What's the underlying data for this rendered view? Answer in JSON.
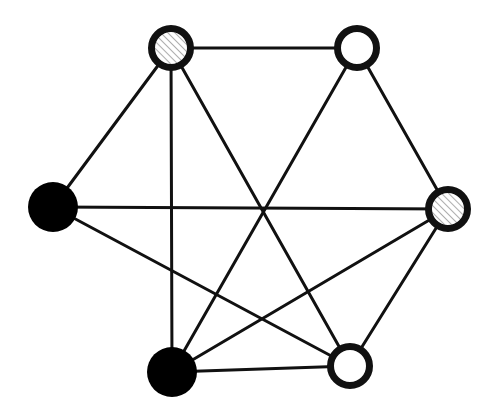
{
  "diagram": {
    "type": "undirected-graph",
    "width": 500,
    "height": 410,
    "colors": {
      "background": "#ffffff",
      "stroke": "#111111",
      "filled": "#000000",
      "empty": "#ffffff",
      "hatch_line": "#9a9a9a"
    },
    "edge_width": 3,
    "node_stroke_width": 7,
    "nodes": [
      {
        "id": "A",
        "x": 171,
        "y": 48,
        "r": 20,
        "style": "hatched"
      },
      {
        "id": "B",
        "x": 357,
        "y": 48,
        "r": 20,
        "style": "empty"
      },
      {
        "id": "C",
        "x": 53,
        "y": 207,
        "r": 25,
        "style": "filled"
      },
      {
        "id": "D",
        "x": 448,
        "y": 209,
        "r": 20,
        "style": "hatched"
      },
      {
        "id": "E",
        "x": 172,
        "y": 372,
        "r": 25,
        "style": "filled"
      },
      {
        "id": "F",
        "x": 350,
        "y": 366,
        "r": 20,
        "style": "empty"
      }
    ],
    "edges": [
      [
        "A",
        "B"
      ],
      [
        "A",
        "C"
      ],
      [
        "A",
        "E"
      ],
      [
        "A",
        "F"
      ],
      [
        "B",
        "E"
      ],
      [
        "B",
        "D"
      ],
      [
        "C",
        "D"
      ],
      [
        "C",
        "F"
      ],
      [
        "D",
        "E"
      ],
      [
        "D",
        "F"
      ],
      [
        "E",
        "F"
      ]
    ]
  }
}
